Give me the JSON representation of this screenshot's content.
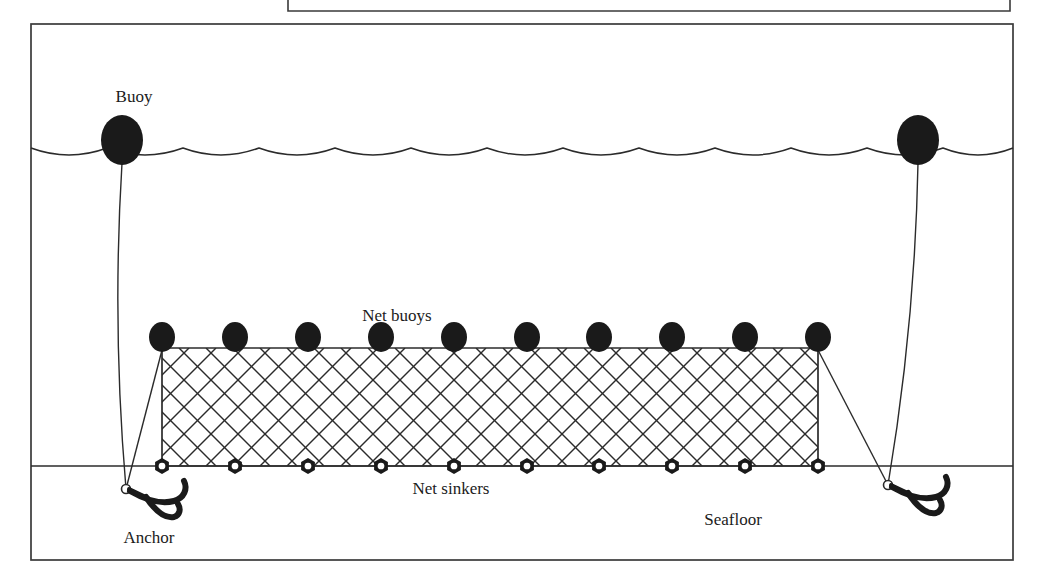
{
  "figure": {
    "background_color": "#ffffff",
    "line_color": "#2b2b2b",
    "fill_color": "#1a1a1a"
  },
  "frame": {
    "outer_border": {
      "x": 31,
      "y": 24,
      "width": 982,
      "height": 536
    },
    "partial_box_above": {
      "x": 288,
      "y": -40,
      "width": 722,
      "height": 52
    }
  },
  "labels": {
    "buoy": "Buoy",
    "net_buoys": "Net buoys",
    "net_sinkers": "Net sinkers",
    "anchor": "Anchor",
    "seafloor": "Seafloor"
  },
  "label_positions": {
    "buoy": {
      "x": 134,
      "y": 102
    },
    "net_buoys": {
      "x": 397,
      "y": 321
    },
    "net_sinkers": {
      "x": 451,
      "y": 494
    },
    "anchor": {
      "x": 149,
      "y": 543
    },
    "seafloor": {
      "x": 733,
      "y": 525
    }
  },
  "diagram_data": {
    "sea_surface": {
      "y": 148,
      "wave_count": 13,
      "wave_width": 76,
      "wave_amplitude": 14,
      "x_start": 31,
      "x_end": 1013
    },
    "seafloor_line": {
      "y": 466,
      "x_start": 31,
      "x_end": 1013
    },
    "surface_buoys": [
      {
        "name": "left-surface-buoy",
        "cx": 122,
        "cy": 140,
        "rx": 21,
        "ry": 25
      },
      {
        "name": "right-surface-buoy",
        "cx": 918,
        "cy": 140,
        "rx": 21,
        "ry": 25
      }
    ],
    "net": {
      "left_x": 162,
      "right_x": 818,
      "top_y": 348,
      "bottom_y": 466,
      "mesh_spacing": 27,
      "buoy_count": 10,
      "sinker_count": 10,
      "buoy_rx": 13,
      "buoy_ry": 15,
      "sinker_r": 8,
      "buoy_x_positions": [
        162,
        235,
        308,
        381,
        454,
        527,
        599,
        672,
        745,
        818
      ],
      "sinker_x_positions": [
        162,
        235,
        308,
        381,
        454,
        527,
        599,
        672,
        745,
        818
      ]
    },
    "anchors": [
      {
        "name": "left-anchor",
        "x": 126,
        "y": 489
      },
      {
        "name": "right-anchor",
        "x": 888,
        "y": 485
      }
    ],
    "ropes": [
      {
        "name": "left-buoy-rope",
        "from": [
          122,
          163
        ],
        "to": [
          126,
          489
        ]
      },
      {
        "name": "left-net-rope",
        "from": [
          162,
          350
        ],
        "to": [
          126,
          489
        ]
      },
      {
        "name": "right-buoy-rope",
        "from": [
          918,
          163
        ],
        "to": [
          888,
          485
        ]
      },
      {
        "name": "right-net-rope",
        "from": [
          818,
          350
        ],
        "to": [
          888,
          485
        ]
      }
    ]
  }
}
